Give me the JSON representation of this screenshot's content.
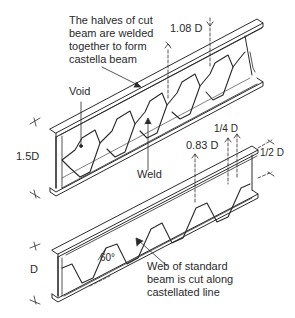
{
  "diagram": {
    "annotations": {
      "top_note": [
        "The halves of cut",
        "beam are welded",
        "together to form",
        "castella beam"
      ],
      "void": "Void",
      "weld": "Weld",
      "dim_depth_top": "1.5D",
      "dim_108": "1.08 D",
      "dim_083": "0.83 D",
      "dim_quarter": "1/4 D",
      "dim_half": "1/2 D",
      "dim_depth_bottom": "D",
      "angle": "60°",
      "bottom_note": [
        "Web of standard",
        "beam is cut along",
        "castellated line"
      ]
    },
    "colors": {
      "line": "#2a2a2a",
      "background": "#ffffff"
    }
  }
}
